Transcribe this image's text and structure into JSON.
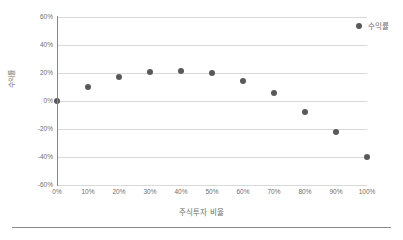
{
  "figure": {
    "background_color": "#ffffff",
    "marker_color": "#595959",
    "gridline_color": "#d9d9d9",
    "axis_color": "#868686",
    "text_color": "#6e6e6e",
    "rule_color": "#8a8a8a"
  },
  "legend": {
    "position": "top-right",
    "entries": [
      {
        "label": "수익률",
        "marker": "filled-circle",
        "color": "#595959"
      }
    ]
  },
  "chart_data": {
    "type": "scatter",
    "title": "",
    "subtitle": "",
    "xlabel": "주식투자 비율",
    "ylabel": "수익률",
    "x": [
      0,
      10,
      20,
      30,
      40,
      50,
      60,
      70,
      80,
      90,
      100
    ],
    "x_tick_labels": [
      "0%",
      "10%",
      "20%",
      "30%",
      "40%",
      "50%",
      "60%",
      "70%",
      "80%",
      "90%",
      "100%"
    ],
    "y_tick_labels": [
      "60%",
      "40%",
      "20%",
      "0%",
      "-20%",
      "-40%",
      "-60%"
    ],
    "y_ticks": [
      60,
      40,
      20,
      0,
      -20,
      -40,
      -60
    ],
    "xlim": [
      0,
      100
    ],
    "ylim": [
      -60,
      60
    ],
    "grid": "horizontal",
    "series": [
      {
        "name": "수익률",
        "color": "#595959",
        "marker": "filled-circle",
        "values": [
          0,
          10,
          17,
          21,
          21.5,
          20,
          14.5,
          6,
          -7.5,
          -22,
          -40
        ]
      }
    ]
  }
}
